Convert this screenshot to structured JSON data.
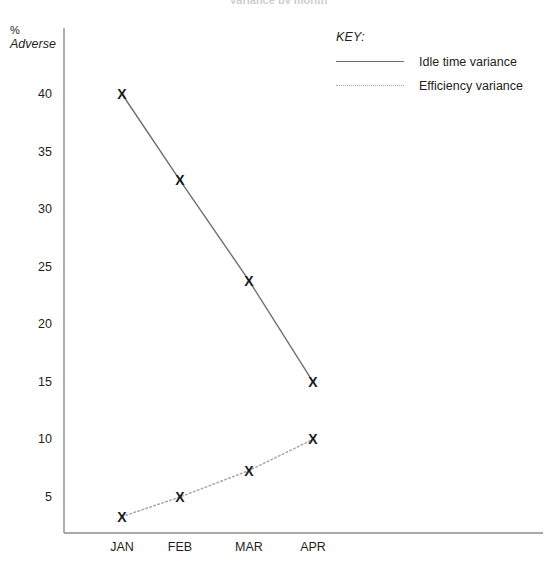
{
  "chart_data": {
    "type": "line",
    "title": "Variance by month",
    "xlabel": "",
    "ylabel": "% Adverse",
    "ylabel_line1": "%",
    "ylabel_line2": "Adverse",
    "categories": [
      "JAN",
      "FEB",
      "MAR",
      "APR"
    ],
    "ylim": [
      0,
      42
    ],
    "yticks": [
      5,
      10,
      15,
      20,
      25,
      30,
      35,
      40
    ],
    "ytick_labels": [
      "5",
      "10",
      "15",
      "20",
      "25",
      "30",
      "35",
      "40"
    ],
    "grid": false,
    "legend_position": "top-right",
    "legend_title": "KEY:",
    "marker": "X",
    "series": [
      {
        "name": "Idle time variance",
        "style": "solid",
        "color": "#6d6e70",
        "values": [
          40,
          32.5,
          23.8,
          15
        ]
      },
      {
        "name": "Efficiency variance",
        "style": "dotted",
        "color": "#a6a8ab",
        "values": [
          3.3,
          5,
          7.3,
          10
        ]
      }
    ]
  },
  "axis": {
    "line_color": "#8a8c8e"
  }
}
